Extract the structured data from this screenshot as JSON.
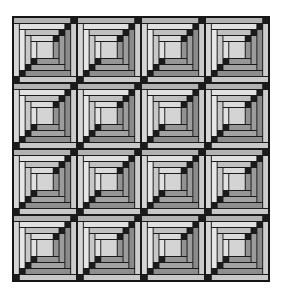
{
  "page": {
    "background_color": "#ffffff",
    "width": 283,
    "height": 296
  },
  "quilt": {
    "description": "log-cabin-quilt-pattern-4x4",
    "rows": 4,
    "cols": 4,
    "x": 12,
    "y": 16,
    "width": 258,
    "height": 266,
    "border_color": "#161616",
    "border_width": 2,
    "gap": 2,
    "seam_color": "#1a1a1a",
    "block": {
      "units": 64,
      "strip": 5,
      "step": 6,
      "rounds": 4,
      "center_color": "#d4d4d4",
      "cornerstone_color": "#1b1b1b",
      "top_shades": [
        "#b2b2b2",
        "#e0e0e0",
        "#c0c0c0",
        "#dadada"
      ],
      "left_shades": [
        "#d6d6d6",
        "#e6e6e6",
        "#c8c8c8",
        "#e0e0e0"
      ],
      "right_shades": [
        "#cccccc",
        "#8a8a8a",
        "#9c9c9c",
        "#929292"
      ],
      "bottom_shades": [
        "#c8c8c8",
        "#8e8e8e",
        "#a2a2a2",
        "#969696"
      ]
    }
  }
}
